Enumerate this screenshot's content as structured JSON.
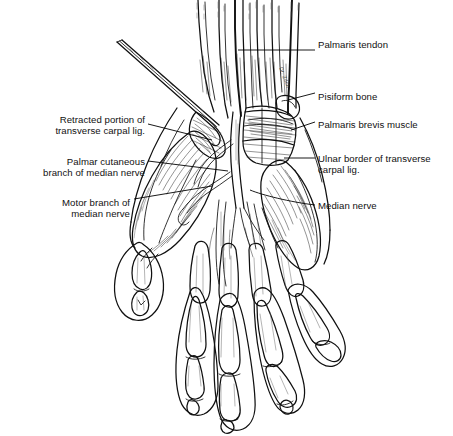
{
  "figure": {
    "background_color": "#ffffff",
    "ink_color": "#101010",
    "width": 453,
    "height": 436,
    "style": "pen-and-ink medical line illustration",
    "signature": "Dr. Zilch"
  },
  "labels": {
    "palmaris_tendon": {
      "text": "Palmaris tendon",
      "side": "right",
      "x": 318,
      "y": 39
    },
    "pisiform_bone": {
      "text": "Pisiform bone",
      "side": "right",
      "x": 318,
      "y": 91
    },
    "palmaris_brevis_muscle": {
      "text": "Palmaris brevis muscle",
      "side": "right",
      "x": 318,
      "y": 119
    },
    "ulnar_border_line1": {
      "text": "Ulnar border of transverse",
      "side": "right",
      "x": 318,
      "y": 153
    },
    "ulnar_border_line2": {
      "text": "carpal lig.",
      "side": "right",
      "x": 318,
      "y": 164
    },
    "median_nerve": {
      "text": "Median nerve",
      "side": "right",
      "x": 318,
      "y": 200
    },
    "retracted_portion_line1": {
      "text": "Retracted portion of",
      "side": "left",
      "x": 145,
      "y": 114
    },
    "retracted_portion_line2": {
      "text": "transverse carpal lig.",
      "side": "left",
      "x": 145,
      "y": 125
    },
    "palmar_cutaneous_line1": {
      "text": "Palmar cutaneous",
      "side": "left",
      "x": 145,
      "y": 156
    },
    "palmar_cutaneous_line2": {
      "text": "branch of median nerve",
      "side": "left",
      "x": 145,
      "y": 167
    },
    "motor_branch_line1": {
      "text": "Motor branch of",
      "side": "left",
      "x": 130,
      "y": 197
    },
    "motor_branch_line2": {
      "text": "median nerve",
      "side": "left",
      "x": 130,
      "y": 208
    }
  },
  "anatomy_parts": [
    "Palmaris tendon",
    "Pisiform bone",
    "Palmaris brevis muscle",
    "Ulnar border of transverse carpal lig.",
    "Median nerve",
    "Retracted portion of transverse carpal lig.",
    "Palmar cutaneous branch of median nerve",
    "Motor branch of median nerve"
  ]
}
